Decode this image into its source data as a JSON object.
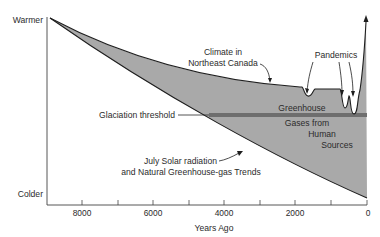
{
  "diagram": {
    "y_axis": {
      "top_label": "Warmer",
      "bottom_label": "Colder"
    },
    "x_axis": {
      "label": "Years Ago",
      "ticks": [
        "8000",
        "6000",
        "4000",
        "2000",
        "0"
      ]
    },
    "annotations": {
      "climate": [
        "Climate in",
        "Northeast Canada"
      ],
      "pandemics": "Pandemics",
      "greenhouse": [
        "Greenhouse",
        "Gases from",
        "Human",
        "Sources"
      ],
      "glaciation": "Glaciation threshold",
      "solar": [
        "July Solar radiation",
        "and Natural Greenhouse-gas Trends"
      ]
    },
    "colors": {
      "fill": "#a9a9a9",
      "threshold_band": "#6e6e6e",
      "line": "#1e1e1e"
    }
  }
}
